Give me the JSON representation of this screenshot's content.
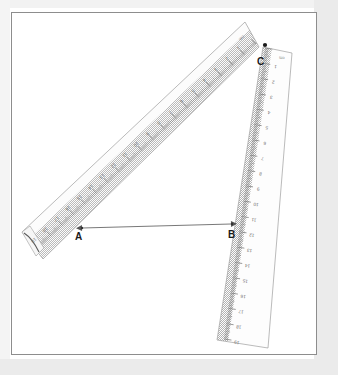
{
  "page": {
    "background_color": "#ffffff",
    "band_color": "#ebebeb",
    "border_color": "#8d8d8d"
  },
  "diagram": {
    "type": "geometry-construction",
    "vertices": [
      {
        "id": "A",
        "label": "A",
        "x": 79,
        "y": 228
      },
      {
        "id": "B",
        "label": "B",
        "x": 233,
        "y": 226
      },
      {
        "id": "C",
        "label": "C",
        "x": 265,
        "y": 45
      }
    ],
    "segments": [
      {
        "from": "A",
        "to": "B",
        "style": "arrow-both",
        "color": "#555555"
      }
    ]
  },
  "rulers": [
    {
      "id": "ruler-diagonal",
      "name": "diagonal-ruler",
      "unit_label": "cm",
      "angle_deg": -41,
      "numbers": [
        1,
        2,
        3,
        4,
        5,
        6,
        7,
        8,
        9,
        10,
        11,
        12,
        13,
        14,
        15,
        16,
        17,
        18,
        19
      ],
      "number_orientation": "inverted",
      "fill_color": "#fbfbfb",
      "edge_color": "#9a9a9a",
      "tick_color": "#6f6f6f"
    },
    {
      "id": "ruler-vertical",
      "name": "vertical-ruler",
      "unit_label": "cm",
      "angle_deg": 12,
      "numbers": [
        1,
        2,
        3,
        4,
        5,
        6,
        7,
        8,
        9,
        10,
        11,
        12,
        13,
        14,
        15,
        16,
        17,
        18,
        19
      ],
      "number_orientation": "inverted",
      "fill_color": "#fcfcfc",
      "edge_color": "#9a9a9a",
      "tick_color": "#6f6f6f"
    }
  ]
}
